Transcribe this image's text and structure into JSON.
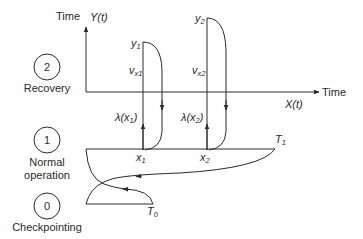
{
  "diagram": {
    "type": "state-transition-time-diagram",
    "states": [
      {
        "id": "2",
        "label": "Recovery"
      },
      {
        "id": "1",
        "label": "Normal\noperation",
        "label_lines": [
          "Normal",
          "operation"
        ]
      },
      {
        "id": "0",
        "label": "Checkpointing"
      }
    ],
    "axes": {
      "y_axis_title": "Time",
      "y_axis_label": "Y(t)",
      "x_axis_title": "Time",
      "x_axis_label": "X(t)"
    },
    "points": {
      "y1": {
        "main": "y",
        "sub": "1"
      },
      "y2": {
        "main": "y",
        "sub": "2"
      },
      "vx1": {
        "main": "v",
        "sub": "x1"
      },
      "vx2": {
        "main": "v",
        "sub": "x2"
      },
      "lambda1": {
        "main": "λ(x",
        "sub": "1",
        "close": ")"
      },
      "lambda2": {
        "main": "λ(x",
        "sub": "2",
        "close": ")"
      },
      "x1": {
        "main": "x",
        "sub": "1"
      },
      "x2": {
        "main": "x",
        "sub": "2"
      },
      "T1": {
        "main": "T",
        "sub": "1"
      },
      "T0": {
        "main": "T",
        "sub": "0"
      }
    },
    "colors": {
      "stroke": "#2a2a2a",
      "background": "#ffffff"
    }
  }
}
